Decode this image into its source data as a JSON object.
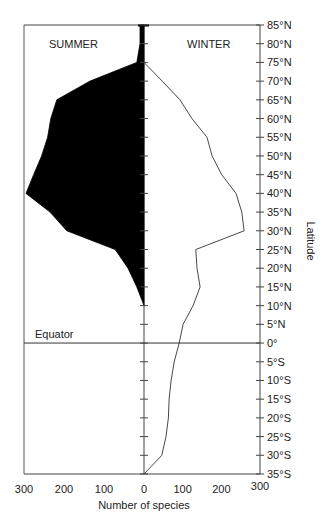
{
  "chart_data": {
    "type": "area",
    "title": "",
    "xlabel": "Number of species",
    "ylabel": "Latitude",
    "panel_labels": {
      "left": "SUMMER",
      "right": "WINTER"
    },
    "annotation": "Equator",
    "x_ticks_left": [
      "300",
      "200",
      "100",
      "0"
    ],
    "x_ticks_right": [
      "100",
      "200",
      "300"
    ],
    "x_tick_values_left": [
      300,
      200,
      100,
      0
    ],
    "x_tick_values_right": [
      100,
      200,
      300
    ],
    "xlim": [
      0,
      300
    ],
    "ylim": [
      -35,
      85
    ],
    "y_ticks": [
      {
        "value": 85,
        "label": "85°N"
      },
      {
        "value": 80,
        "label": "80°N"
      },
      {
        "value": 75,
        "label": "75°N"
      },
      {
        "value": 70,
        "label": "70°N"
      },
      {
        "value": 65,
        "label": "65°N"
      },
      {
        "value": 60,
        "label": "60°N"
      },
      {
        "value": 55,
        "label": "55°N"
      },
      {
        "value": 50,
        "label": "50°N"
      },
      {
        "value": 45,
        "label": "45°N"
      },
      {
        "value": 40,
        "label": "40°N"
      },
      {
        "value": 35,
        "label": "35°N"
      },
      {
        "value": 30,
        "label": "30°N"
      },
      {
        "value": 25,
        "label": "25°N"
      },
      {
        "value": 20,
        "label": "20°N"
      },
      {
        "value": 15,
        "label": "15°N"
      },
      {
        "value": 10,
        "label": "10°N"
      },
      {
        "value": 5,
        "label": "5°N"
      },
      {
        "value": 0,
        "label": "0°"
      },
      {
        "value": -5,
        "label": "5°S"
      },
      {
        "value": -10,
        "label": "10°S"
      },
      {
        "value": -15,
        "label": "15°S"
      },
      {
        "value": -20,
        "label": "20°S"
      },
      {
        "value": -25,
        "label": "25°S"
      },
      {
        "value": -30,
        "label": "30°S"
      },
      {
        "value": -35,
        "label": "35°S"
      }
    ],
    "grid": false,
    "series": [
      {
        "name": "SUMMER",
        "side": "left",
        "style": "filled-black",
        "latitude": [
          85,
          80,
          75,
          70,
          65,
          60,
          55,
          50,
          45,
          40,
          35,
          30,
          25,
          20,
          15,
          10
        ],
        "values": [
          10,
          10,
          18,
          135,
          218,
          233,
          241,
          256,
          276,
          295,
          235,
          193,
          72,
          40,
          18,
          0
        ]
      },
      {
        "name": "WINTER",
        "side": "right",
        "style": "line",
        "latitude": [
          75,
          70,
          65,
          60,
          55,
          50,
          45,
          40,
          35,
          30,
          25,
          20,
          15,
          10,
          5,
          0,
          -5,
          -10,
          -15,
          -20,
          -25,
          -30,
          -35
        ],
        "values": [
          0,
          47,
          93,
          124,
          163,
          176,
          201,
          238,
          253,
          259,
          134,
          137,
          145,
          127,
          101,
          91,
          78,
          70,
          65,
          63,
          57,
          46,
          0
        ]
      }
    ]
  }
}
